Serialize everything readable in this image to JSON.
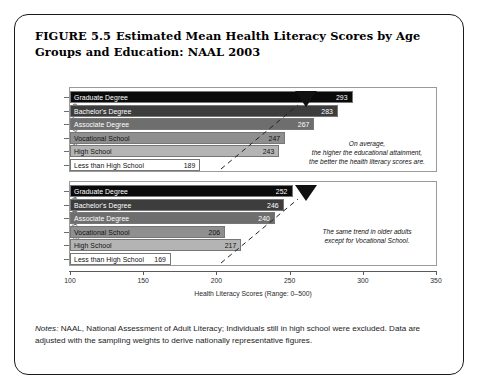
{
  "figure": {
    "number": "FIGURE 5.5",
    "title": "Estimated Mean Health Literacy Scores by Age Groups and Education: NAAL 2003",
    "notes_label": "Notes:",
    "notes_text": " NAAL, National Assessment of Adult Literacy; Individuals still in high school were excluded. Data are adjusted with the sampling weights to derive nationally representative figures."
  },
  "chart_data": {
    "type": "bar",
    "orientation": "horizontal",
    "title": "Estimated Mean Health Literacy Scores by Age Groups and Education: NAAL 2003",
    "xlabel": "Health Literacy Scores (Range: 0–500)",
    "ylabel": "",
    "xlim": [
      100,
      350
    ],
    "xticks": [
      100,
      150,
      200,
      250,
      300,
      350
    ],
    "xtick_labels": [
      "100",
      "150",
      "200",
      "250",
      "300",
      "350"
    ],
    "grid": false,
    "legend": "none",
    "categories": [
      "Graduate Degree",
      "Bachelor's Degree",
      "Associate Degree",
      "Vocational School",
      "High School",
      "Less than High School"
    ],
    "panels": [
      {
        "group_label": "Age 64 and Younger",
        "values": [
          293,
          283,
          267,
          247,
          243,
          189
        ],
        "value_labels": [
          "293",
          "283",
          "267",
          "247",
          "243",
          "189"
        ],
        "bar_colors": [
          "#0a0a0a",
          "#3d3d3d",
          "#6e6e6e",
          "#8f8f8f",
          "#b4b4b4",
          "#ffffff"
        ],
        "label_colors": [
          "#ffffff",
          "#ffffff",
          "#ffffff",
          "#111111",
          "#111111",
          "#111111"
        ],
        "value_colors": [
          "#ffffff",
          "#ffffff",
          "#ffffff",
          "#111111",
          "#111111",
          "#111111"
        ],
        "annotation": "On average,\nthe higher the educational attainment,\nthe better the health literacy scores are."
      },
      {
        "group_label": "Age 65 and Older",
        "values": [
          252,
          246,
          240,
          206,
          217,
          169
        ],
        "value_labels": [
          "252",
          "246",
          "240",
          "206",
          "217",
          "169"
        ],
        "bar_colors": [
          "#0a0a0a",
          "#3d3d3d",
          "#6e6e6e",
          "#8f8f8f",
          "#b4b4b4",
          "#ffffff"
        ],
        "label_colors": [
          "#ffffff",
          "#ffffff",
          "#ffffff",
          "#111111",
          "#111111",
          "#111111"
        ],
        "value_colors": [
          "#ffffff",
          "#ffffff",
          "#ffffff",
          "#111111",
          "#111111",
          "#111111"
        ],
        "annotation": "The same trend in older adults\nexcept for Vocational School."
      }
    ]
  },
  "colors": {
    "frame": "#1a1a1a",
    "background": "#ffffff",
    "axis": "#5a5a5a",
    "text": "#111111"
  }
}
